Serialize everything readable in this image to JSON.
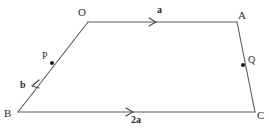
{
  "figure": {
    "background_color": "#ffffff",
    "stroke_color": "#5a5a5a",
    "label_color": "#2b2b2b",
    "width": 269,
    "height": 132,
    "vertices": [
      {
        "name": "O",
        "label": "O",
        "x": 88,
        "y": 22,
        "label_x": 78,
        "label_y": 7
      },
      {
        "name": "A",
        "label": "A",
        "x": 237,
        "y": 22,
        "label_x": 238,
        "label_y": 10
      },
      {
        "name": "C",
        "label": "C",
        "x": 255,
        "y": 112,
        "label_x": 257,
        "label_y": 110
      },
      {
        "name": "B",
        "label": "B",
        "x": 18,
        "y": 112,
        "label_x": 4,
        "label_y": 108
      }
    ],
    "points": [
      {
        "name": "P",
        "label": "P",
        "x": 52,
        "y": 63,
        "label_x": 42,
        "label_y": 51,
        "dot_radius": 2.0
      },
      {
        "name": "Q",
        "label": "Q",
        "x": 243,
        "y": 65,
        "label_x": 248,
        "label_y": 55,
        "dot_radius": 2.0
      }
    ],
    "edges": [
      {
        "name": "edge-OA",
        "from": "O",
        "to": "A"
      },
      {
        "name": "edge-AC",
        "from": "A",
        "to": "C"
      },
      {
        "name": "edge-CB",
        "from": "C",
        "to": "B"
      },
      {
        "name": "edge-BO",
        "from": "B",
        "to": "O"
      }
    ],
    "vectors": [
      {
        "name": "vector-a",
        "label": "a",
        "on_edge": "edge-OA",
        "direction": "O to A",
        "arrow_x": 155,
        "arrow_y": 22,
        "arrow_angle_deg": 0,
        "label_x": 157,
        "label_y": 5
      },
      {
        "name": "vector-b",
        "label": "b",
        "on_edge": "edge-BO",
        "direction": "O to B",
        "arrow_x": 34,
        "arrow_y": 84,
        "arrow_angle_deg": 209,
        "label_x": 20,
        "label_y": 80
      },
      {
        "name": "vector-2a",
        "label": "2a",
        "on_edge": "edge-BC",
        "direction": "B to C",
        "arrow_x": 132,
        "arrow_y": 112,
        "arrow_angle_deg": 0,
        "label_x": 131,
        "label_y": 115
      }
    ]
  }
}
